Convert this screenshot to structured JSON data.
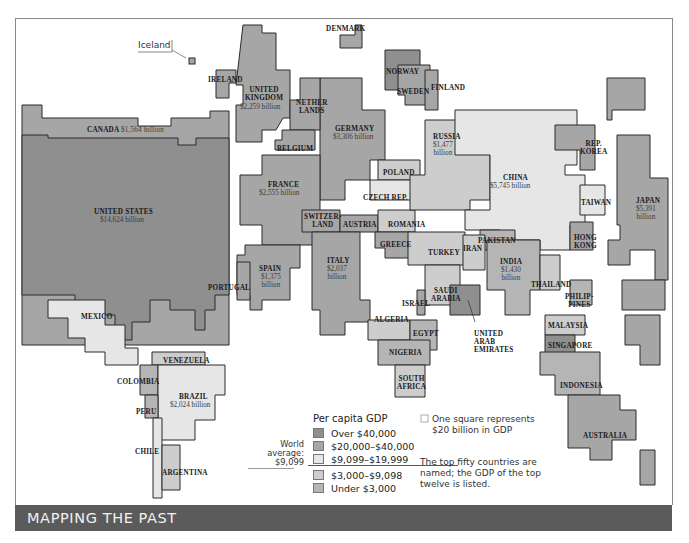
{
  "banner": {
    "title": "MAPPING THE PAST"
  },
  "colors": {
    "over_40000": "#8f8f8f",
    "20000_40000": "#a6a6a6",
    "9099_19999": "#e6e6e6",
    "3000_9098": "#cdcdcd",
    "under_3000": "#b5b5b5",
    "border": "#2a2a2a",
    "banner": "#5b5b5b"
  },
  "legend": {
    "title": "Per capita GDP",
    "items": [
      {
        "label": "Over $40,000",
        "color": "#8f8f8f"
      },
      {
        "label": "$20,000–$40,000",
        "color": "#a6a6a6"
      },
      {
        "label": "$9,099–$19,999",
        "color": "#e6e6e6"
      },
      {
        "label": "$3,000–$9,098",
        "color": "#cdcdcd"
      },
      {
        "label": "Under $3,000",
        "color": "#b5b5b5"
      }
    ],
    "world_average": {
      "line1": "World",
      "line2": "average:",
      "line3": "$9,099"
    },
    "square_note": {
      "line1": "One square represents",
      "line2": "$20 billion in GDP"
    },
    "names_note": {
      "line1": "The top fifty countries are",
      "line2": "named; the GDP of the top",
      "line3": "twelve is listed."
    }
  },
  "countries": [
    {
      "name": "Iceland"
    },
    {
      "name": "IRELAND"
    },
    {
      "name": "UNITED",
      "name2": "KINGDOM",
      "gdp": "$2,259 billion"
    },
    {
      "name": "DENMARK"
    },
    {
      "name": "NORWAY"
    },
    {
      "name": "SWEDEN"
    },
    {
      "name": "FINLAND"
    },
    {
      "name": "NETHER",
      "name2": "LANDS"
    },
    {
      "name": "GERMANY",
      "gdp": "$3,306 billion"
    },
    {
      "name": "BELGIUM"
    },
    {
      "name": "FRANCE",
      "gdp": "$2,555 billion"
    },
    {
      "name": "CANADA",
      "gdp": "$1,564 billion"
    },
    {
      "name": "UNITED STATES",
      "gdp": "$14,624 billion"
    },
    {
      "name": "RUSSIA",
      "gdp": "$1,477",
      "gdp2": "billion"
    },
    {
      "name": "POLAND"
    },
    {
      "name": "CZECH REP."
    },
    {
      "name": "SWITZER-",
      "name2": "LAND"
    },
    {
      "name": "AUSTRIA"
    },
    {
      "name": "ROMANIA"
    },
    {
      "name": "GREECE"
    },
    {
      "name": "TURKEY"
    },
    {
      "name": "SPAIN",
      "gdp": "$1,375",
      "gdp2": "billion"
    },
    {
      "name": "PORTUGAL"
    },
    {
      "name": "ITALY",
      "gdp": "$2,037",
      "gdp2": "billion"
    },
    {
      "name": "CHINA",
      "gdp": "$5,745 billion"
    },
    {
      "name": "REP.",
      "name2": "KOREA"
    },
    {
      "name": "JAPAN",
      "gdp": "$5,391",
      "gdp2": "billion"
    },
    {
      "name": "TAIWAN"
    },
    {
      "name": "HONG",
      "name2": "KONG"
    },
    {
      "name": "PAKISTAN"
    },
    {
      "name": "IRAN"
    },
    {
      "name": "INDIA",
      "gdp": "$1,430",
      "gdp2": "billion"
    },
    {
      "name": "THAILAND"
    },
    {
      "name": "PHILIP-",
      "name2": "PINES"
    },
    {
      "name": "MALAYSIA"
    },
    {
      "name": "SINGAPORE"
    },
    {
      "name": "INDONESIA"
    },
    {
      "name": "AUSTRALIA"
    },
    {
      "name": "ISRAEL"
    },
    {
      "name": "SAUDI",
      "name2": "ARABIA"
    },
    {
      "name": "UNITED",
      "name2": "ARAB",
      "name3": "EMIRATES"
    },
    {
      "name": "ALGERIA"
    },
    {
      "name": "EGYPT"
    },
    {
      "name": "NIGERIA"
    },
    {
      "name": "SOUTH",
      "name2": "AFRICA"
    },
    {
      "name": "MEXICO"
    },
    {
      "name": "VENEZUELA"
    },
    {
      "name": "COLOMBIA"
    },
    {
      "name": "BRAZIL",
      "gdp": "$2,024 billion"
    },
    {
      "name": "PERU"
    },
    {
      "name": "CHILE"
    },
    {
      "name": "ARGENTINA"
    }
  ]
}
